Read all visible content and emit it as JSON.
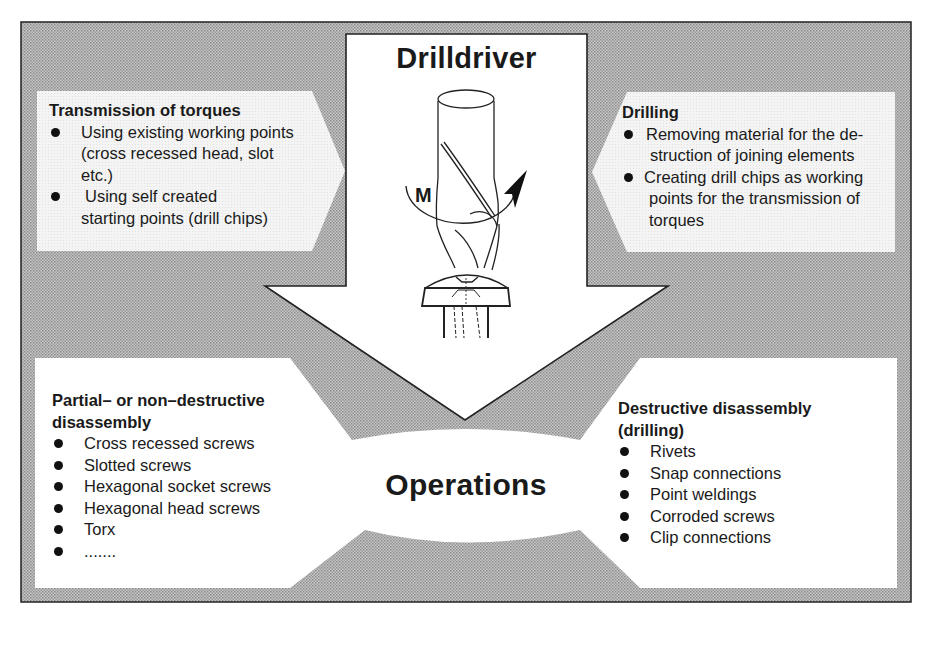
{
  "diagram": {
    "colors": {
      "background": "#ffffff",
      "stipple_fill": "#bdbdbd",
      "stipple_dot": "#8a8a8a",
      "light_box": "#f3f3f3",
      "white_region": "#ffffff",
      "outline": "#222222",
      "text": "#1a1a1a"
    },
    "arrow": {
      "title": "Drilldriver",
      "torque_label": "M"
    },
    "top_left": {
      "title": "Transmission of torques",
      "items": [
        "Using existing working points (cross recessed head, slot etc.)",
        "Using self created starting points (drill chips)"
      ],
      "item_lines": [
        [
          "Using existing working points",
          "(cross recessed head, slot",
          "etc.)"
        ],
        [
          "Using self created",
          "starting points (drill chips)"
        ]
      ]
    },
    "top_right": {
      "title": "Drilling",
      "items": [
        "Removing material for the destruction of joining elements",
        "Creating drill chips as working points for the transmission of torques"
      ],
      "item_lines": [
        [
          "Removing material for the de-",
          "struction of joining elements"
        ],
        [
          "Creating drill chips as working",
          "points for the transmission of",
          "torques"
        ]
      ]
    },
    "center": {
      "title": "Operations"
    },
    "bottom_left": {
      "title_lines": [
        "Partial– or non–destructive",
        "disassembly"
      ],
      "items": [
        "Cross recessed screws",
        "Slotted screws",
        "Hexagonal socket screws",
        "Hexagonal head screws",
        "Torx",
        "......."
      ]
    },
    "bottom_right": {
      "title_lines": [
        "Destructive disassembly",
        "(drilling)"
      ],
      "items": [
        "Rivets",
        "Snap connections",
        "Point weldings",
        "Corroded screws",
        "Clip connections"
      ]
    }
  }
}
